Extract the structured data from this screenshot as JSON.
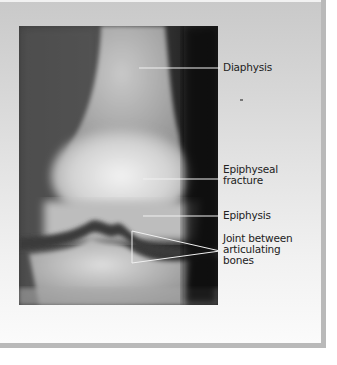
{
  "figure": {
    "labels": [
      {
        "id": "diaphysis",
        "lines": [
          "Diaphysis"
        ]
      },
      {
        "id": "epiphyseal-fracture",
        "lines": [
          "Epiphyseal",
          "fracture"
        ]
      },
      {
        "id": "epiphysis",
        "lines": [
          "Epiphysis"
        ]
      },
      {
        "id": "joint",
        "lines": [
          "Joint between",
          "articulating",
          "bones"
        ]
      }
    ],
    "colors": {
      "panel_top": "#c9c9c9",
      "panel_bottom": "#fbfbfb",
      "border": "#b9b9b9",
      "leader_line": "#f0f0f0",
      "text": "#222222"
    }
  }
}
